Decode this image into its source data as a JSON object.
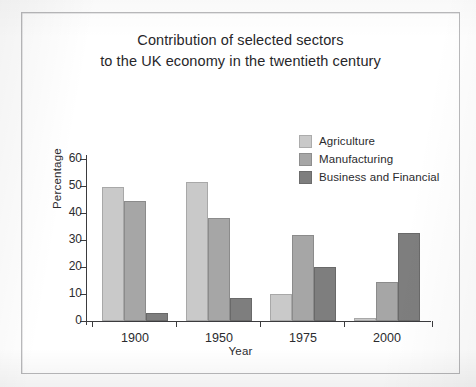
{
  "figure": {
    "frame_border_color": "#b9b9bb",
    "background": "#ffffff"
  },
  "chart_data": {
    "type": "bar",
    "title": "Contribution of selected sectors to the UK economy in the twentieth century",
    "title_lines": [
      "Contribution of selected sectors",
      "to the UK economy in the twentieth century"
    ],
    "xlabel": "Year",
    "ylabel": "Percentage",
    "categories": [
      "1900",
      "1950",
      "1975",
      "2000"
    ],
    "ylim": [
      0,
      60
    ],
    "yticks": [
      0,
      10,
      20,
      30,
      40,
      50,
      60
    ],
    "ytick_labels": [
      "0",
      "10",
      "20",
      "30",
      "40",
      "50",
      "60"
    ],
    "grid": false,
    "legend_position": "upper right",
    "series": [
      {
        "name": "Agriculture",
        "color": "#c9c9c9",
        "values": [
          49.5,
          51.5,
          10,
          1
        ]
      },
      {
        "name": "Manufacturing",
        "color": "#a6a6a6",
        "values": [
          44.5,
          38,
          32,
          14.5
        ]
      },
      {
        "name": "Business and Financial",
        "color": "#7e7e7e",
        "values": [
          3,
          8.5,
          20,
          32.5
        ]
      }
    ]
  }
}
